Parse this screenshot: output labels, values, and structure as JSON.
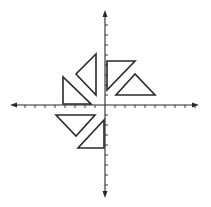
{
  "diagram": {
    "type": "coordinate-plane",
    "colors": {
      "stroke": "#2a2a2a",
      "background": "#ffffff"
    },
    "origin_px": [
      105,
      105
    ],
    "unit_px": 10,
    "x_axis": {
      "min_px": 10,
      "max_px": 199,
      "ticks": [
        -8,
        -7,
        -6,
        -5,
        -4,
        -3,
        -2,
        -1,
        1,
        2,
        3,
        4,
        5,
        6,
        7,
        8,
        9
      ]
    },
    "y_axis": {
      "min_px": 10,
      "max_px": 198,
      "ticks": [
        -8,
        -7,
        -6,
        -5,
        -4,
        -3,
        -2,
        -1,
        1,
        2,
        3,
        4,
        5,
        6,
        7,
        8
      ]
    },
    "triangles": [
      {
        "id": "A",
        "points": "107,61 135,61 107,90"
      },
      {
        "id": "B",
        "points": "135,74 116,95 155,95"
      },
      {
        "id": "C",
        "points": "96,54 76,74 96,95"
      },
      {
        "id": "D",
        "points": "63,77 63,104 91,104"
      },
      {
        "id": "E",
        "points": "56,115 95,115 76,136"
      },
      {
        "id": "F",
        "points": "104,120 78,148 104,148"
      }
    ]
  }
}
